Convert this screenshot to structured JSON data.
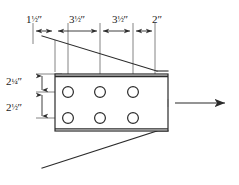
{
  "figure": {
    "units": "inches",
    "colors": {
      "line": "#2b2b2b",
      "thin_line": "#555555",
      "background": "#ffffff",
      "text": "#1a1a1a"
    }
  },
  "dimensions": {
    "horizontal": [
      {
        "id": "h1",
        "whole": "1",
        "fraction": "½",
        "mark": "″",
        "value": 1.5,
        "full": "1½″"
      },
      {
        "id": "h2",
        "whole": "3",
        "fraction": "½",
        "mark": "″",
        "value": 3.5,
        "full": "3½″"
      },
      {
        "id": "h3",
        "whole": "3",
        "fraction": "½",
        "mark": "″",
        "value": 3.5,
        "full": "3½″"
      },
      {
        "id": "h4",
        "whole": "2",
        "fraction": "",
        "mark": "″",
        "value": 2.0,
        "full": "2″"
      }
    ],
    "vertical": [
      {
        "id": "v1",
        "whole": "2",
        "fraction": "¼",
        "mark": "″",
        "value": 2.25,
        "full": "2¼″"
      },
      {
        "id": "v2",
        "whole": "2",
        "fraction": "½",
        "mark": "″",
        "value": 2.5,
        "full": "2½″"
      }
    ]
  },
  "plate": {
    "name": "gusset-plate",
    "hole_rows": 2,
    "holes_per_row": 3,
    "hole_count": 6
  },
  "load": {
    "name": "applied-force-arrow",
    "direction": "right",
    "label": ""
  }
}
